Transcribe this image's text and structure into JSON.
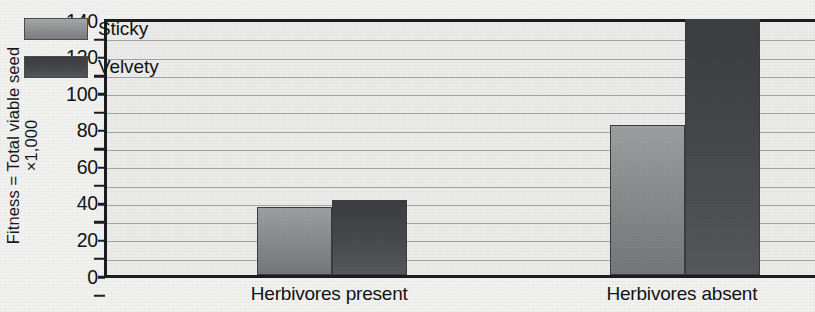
{
  "chart_data": {
    "type": "bar",
    "title": "",
    "subtitle": "",
    "xlabel": "",
    "ylabel": "Fitness = Total viable seed ×1,000",
    "ylabel_lines": [
      "Fitness = Total viable seed",
      "×1,000"
    ],
    "categories": [
      "Herbivores present",
      "Herbivores absent"
    ],
    "series": [
      {
        "name": "Sticky",
        "values": [
          37,
          82
        ],
        "color": "#8b8d90"
      },
      {
        "name": "Velvety",
        "values": [
          41,
          142
        ],
        "color": "#45474a"
      }
    ],
    "ylim": [
      0,
      140
    ],
    "ytick_major": [
      0,
      20,
      40,
      60,
      80,
      100,
      120,
      140
    ],
    "ytick_labels": [
      "0",
      "20",
      "40",
      "60",
      "80",
      "100",
      "120",
      "140"
    ],
    "ytick_minor_step": 10,
    "grid": true,
    "grid_step": 10,
    "legend_position": "top-left",
    "legend_entries": [
      "Sticky",
      "Velvety"
    ],
    "axis_color": "#1c1d1f",
    "grid_color": "#9a9d9f",
    "plot_background": "#ececeb",
    "figure_background": "#f2f2f0"
  }
}
